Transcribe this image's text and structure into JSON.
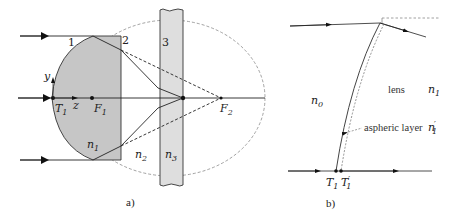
{
  "figure": {
    "panel_a": {
      "caption": "a)",
      "surface_labels": {
        "surface1": "1",
        "surface2": "2",
        "surface3": "3"
      },
      "axis_labels": {
        "y": "y",
        "z": "z"
      },
      "points": {
        "T1": {
          "base": "T",
          "sub": "1"
        },
        "F1": {
          "base": "F",
          "sub": "1"
        },
        "F2": {
          "base": "F",
          "sub": "2"
        }
      },
      "media": {
        "n1": {
          "base": "n",
          "sub": "1"
        },
        "n2": {
          "base": "n",
          "sub": "2"
        },
        "n3": {
          "base": "n",
          "sub": "3"
        }
      },
      "colors": {
        "lens_fill": "#c8c8c8",
        "window_fill": "#dcdcdc",
        "ellipse": "#888888",
        "ray": "#222222"
      }
    },
    "panel_b": {
      "caption": "b)",
      "lens_label": "lens",
      "aspheric_label": "aspheric layer",
      "media": {
        "n0": {
          "base": "n",
          "sub": "0"
        },
        "n1": {
          "base": "n",
          "sub": "1"
        },
        "n1_prime": {
          "base": "n",
          "sub": "1",
          "prime": "′"
        }
      },
      "points": {
        "T1": {
          "base": "T",
          "sub": "1"
        },
        "T1_prime": {
          "base": "T",
          "sub": "1",
          "prime": "′"
        }
      }
    }
  }
}
